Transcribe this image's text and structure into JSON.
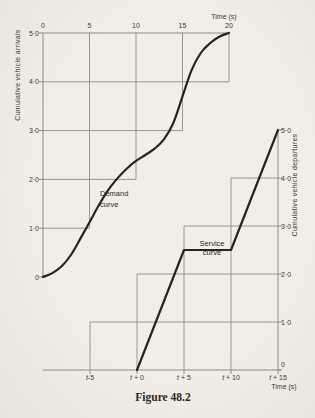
{
  "figure_caption": "Figure 48.2",
  "colors": {
    "paper": "#f0eee7",
    "curve_ink": "#262420",
    "thin_line": "#8f8c83",
    "text": "#3a372f"
  },
  "arrivals": {
    "axis_label_y": "Cumulative vehicle arrivals",
    "axis_label_x": "Time (s)",
    "x_ticks": [
      "0",
      "5",
      "10",
      "15",
      "20"
    ],
    "y_ticks": [
      "5·0",
      "4·0",
      "3·0",
      "2·0",
      "1·0",
      "0"
    ],
    "curve_label": [
      "Demand",
      "curve"
    ]
  },
  "departures": {
    "axis_label_y": "Cumulative vehicle departures",
    "axis_label_x": "Time (s)",
    "x_ticks": [
      {
        "base": "t",
        "offset": "-5"
      },
      {
        "base": "t",
        "offset": " + 0"
      },
      {
        "base": "t",
        "offset": " + 5"
      },
      {
        "base": "t",
        "offset": " + 10"
      },
      {
        "base": "t",
        "offset": " + 15"
      }
    ],
    "y_ticks": [
      "5·0",
      "4·0",
      "3·0",
      "2·0",
      "1·0",
      "0"
    ],
    "curve_label": [
      "Service",
      "curve"
    ]
  },
  "chart_data": [
    {
      "type": "line",
      "name": "demand-curve",
      "title": "Demand curve",
      "xlabel": "Time (s)",
      "ylabel": "Cumulative vehicle arrivals",
      "xlim": [
        0,
        20
      ],
      "ylim": [
        0,
        5
      ],
      "x": [
        0,
        1,
        2,
        3,
        4,
        5,
        6,
        7,
        8,
        9,
        10,
        11,
        12,
        13,
        14,
        15,
        16,
        17,
        18,
        19,
        20
      ],
      "y": [
        0,
        0.08,
        0.22,
        0.45,
        0.78,
        1.12,
        1.47,
        1.78,
        2.02,
        2.22,
        2.38,
        2.5,
        2.63,
        2.82,
        3.15,
        3.7,
        4.25,
        4.6,
        4.8,
        4.93,
        5.0
      ],
      "step_markers": [
        [
          5,
          1
        ],
        [
          10,
          2
        ],
        [
          15,
          3
        ],
        [
          20,
          4
        ]
      ],
      "grid": false,
      "legend": "none"
    },
    {
      "type": "line",
      "name": "service-curve",
      "title": "Service curve",
      "xlabel": "Time (s)",
      "ylabel": "Cumulative vehicle departures",
      "x_unit": "seconds relative to t",
      "xlim": [
        -5,
        15
      ],
      "ylim": [
        0,
        5
      ],
      "x": [
        0,
        5,
        10,
        15
      ],
      "y": [
        0,
        2.5,
        2.5,
        5.0
      ],
      "step_markers": [
        [
          -5,
          1
        ],
        [
          0,
          2
        ],
        [
          5,
          3
        ],
        [
          10,
          4
        ]
      ],
      "grid": false,
      "legend": "none"
    }
  ]
}
